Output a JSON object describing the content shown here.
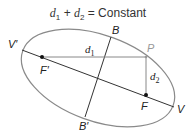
{
  "title": {
    "d1": "d",
    "d1_sub": "1",
    "plus": " + ",
    "d2": "d",
    "d2_sub": "2",
    "rest": " = Constant"
  },
  "labels": {
    "V_prime": "V′",
    "V": "V",
    "B": "B",
    "B_prime": "B′",
    "F_prime": "F′",
    "F": "F",
    "P": "P",
    "d1": "d",
    "d1_sub": "1",
    "d2": "d",
    "d2_sub": "2"
  },
  "colors": {
    "ellipse": "#8a8a8a",
    "axes": "#333333",
    "focal_lines": "#888888",
    "point_P_label": "#999999"
  }
}
